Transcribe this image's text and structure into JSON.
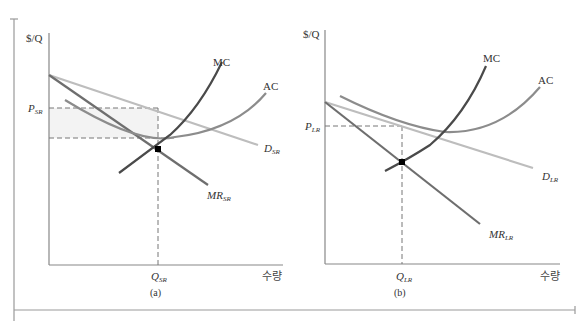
{
  "colors": {
    "axis": "#888888",
    "mc": "#4a4a4a",
    "ac": "#8c8c8c",
    "demand": "#bdbdbd",
    "mr": "#6e6e6e",
    "dashed": "#777777",
    "shade": "#f4f4f4",
    "point": "#000000"
  },
  "panels": [
    {
      "id": "a",
      "caption": "(a)",
      "y_axis_label": "$/Q",
      "x_axis_label": "수량",
      "price_label_main": "P",
      "price_label_sub": "SR",
      "quantity_label_main": "Q",
      "quantity_label_sub": "SR",
      "curves": {
        "mc": "MC",
        "ac": "AC",
        "demand_main": "D",
        "demand_sub": "SR",
        "mr_main": "MR",
        "mr_sub": "SR"
      }
    },
    {
      "id": "b",
      "caption": "(b)",
      "y_axis_label": "$/Q",
      "x_axis_label": "수량",
      "price_label_main": "P",
      "price_label_sub": "LR",
      "quantity_label_main": "Q",
      "quantity_label_sub": "LR",
      "curves": {
        "mc": "MC",
        "ac": "AC",
        "demand_main": "D",
        "demand_sub": "LR",
        "mr_main": "MR",
        "mr_sub": "LR"
      }
    }
  ]
}
